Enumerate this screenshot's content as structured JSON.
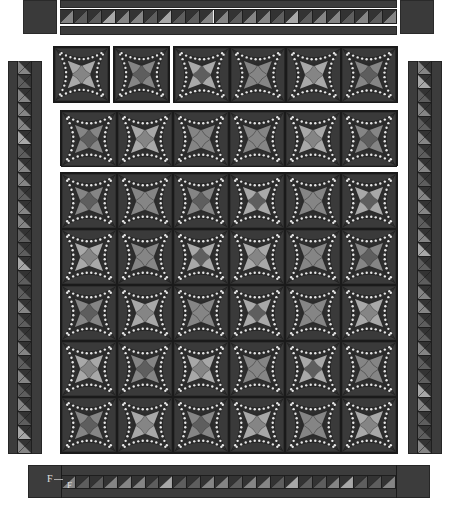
{
  "diagram": {
    "type": "quilt-layout",
    "colors": {
      "background": "#ffffff",
      "fabric_dark": "#3a3a3a",
      "seam": "#1a1a1a",
      "star_points": "#e8e8e8",
      "tone_light": "#a8a8a8",
      "tone_mid": "#858585",
      "tone_dark": "#5e5e5e"
    },
    "labels": {
      "bottom_border_outer": "F",
      "bottom_border_inner": "F"
    },
    "caption": "",
    "top_border": {
      "hst_count": 24,
      "tones": [
        "mid",
        "dark",
        "dark",
        "light",
        "mid",
        "mid",
        "dark",
        "light",
        "dark",
        "dark",
        "mid",
        "mid",
        "dark",
        "mid",
        "mid",
        "dark",
        "light",
        "dark",
        "mid",
        "mid",
        "dark",
        "mid",
        "dark",
        "mid"
      ]
    },
    "left_border": {
      "hst_count": 28,
      "tones": [
        "mid",
        "dark",
        "mid",
        "mid",
        "mid",
        "light",
        "dark",
        "mid",
        "mid",
        "dark",
        "mid",
        "mid",
        "dark",
        "dark",
        "light",
        "dark",
        "dark",
        "mid",
        "dark",
        "dark",
        "mid",
        "dark",
        "mid",
        "dark",
        "mid",
        "dark",
        "light",
        "mid"
      ]
    },
    "right_border": {
      "hst_count": 28,
      "tones": [
        "mid",
        "light",
        "dark",
        "mid",
        "dark",
        "mid",
        "dark",
        "mid",
        "dark",
        "mid",
        "mid",
        "dark",
        "mid",
        "light",
        "dark",
        "dark",
        "mid",
        "mid",
        "dark",
        "dark",
        "mid",
        "dark",
        "dark",
        "light",
        "mid",
        "dark",
        "dark",
        "mid"
      ]
    },
    "bottom_border": {
      "hst_count": 24,
      "tones": [
        "mid",
        "dark",
        "dark",
        "mid",
        "mid",
        "mid",
        "dark",
        "light",
        "dark",
        "dark",
        "mid",
        "mid",
        "dark",
        "mid",
        "mid",
        "dark",
        "light",
        "dark",
        "dark",
        "mid",
        "light",
        "dark",
        "dark",
        "mid"
      ]
    },
    "row1_separate_blocks": [
      {
        "center": "mid",
        "petals": "light"
      },
      {
        "center": "dark",
        "petals": "mid"
      }
    ],
    "row1_joined_blocks": [
      {
        "center": "dark",
        "petals": "light"
      },
      {
        "center": "mid",
        "petals": "mid"
      },
      {
        "center": "mid",
        "petals": "light"
      },
      {
        "center": "dark",
        "petals": "mid"
      }
    ],
    "row2_blocks": [
      {
        "center": "dark",
        "petals": "mid"
      },
      {
        "center": "mid",
        "petals": "light"
      },
      {
        "center": "mid",
        "petals": "mid"
      },
      {
        "center": "mid",
        "petals": "mid"
      },
      {
        "center": "mid",
        "petals": "light"
      },
      {
        "center": "dark",
        "petals": "mid"
      }
    ],
    "main_grid": {
      "rows": 5,
      "cols": 6,
      "blocks": [
        [
          {
            "center": "dark",
            "petals": "mid"
          },
          {
            "center": "mid",
            "petals": "mid"
          },
          {
            "center": "dark",
            "petals": "mid"
          },
          {
            "center": "dark",
            "petals": "light"
          },
          {
            "center": "mid",
            "petals": "mid"
          },
          {
            "center": "dark",
            "petals": "light"
          }
        ],
        [
          {
            "center": "mid",
            "petals": "light"
          },
          {
            "center": "mid",
            "petals": "mid"
          },
          {
            "center": "dark",
            "petals": "light"
          },
          {
            "center": "mid",
            "petals": "light"
          },
          {
            "center": "mid",
            "petals": "mid"
          },
          {
            "center": "dark",
            "petals": "mid"
          }
        ],
        [
          {
            "center": "dark",
            "petals": "mid"
          },
          {
            "center": "mid",
            "petals": "light"
          },
          {
            "center": "mid",
            "petals": "mid"
          },
          {
            "center": "dark",
            "petals": "light"
          },
          {
            "center": "mid",
            "petals": "mid"
          },
          {
            "center": "mid",
            "petals": "light"
          }
        ],
        [
          {
            "center": "mid",
            "petals": "light"
          },
          {
            "center": "dark",
            "petals": "mid"
          },
          {
            "center": "mid",
            "petals": "light"
          },
          {
            "center": "mid",
            "petals": "mid"
          },
          {
            "center": "dark",
            "petals": "light"
          },
          {
            "center": "mid",
            "petals": "mid"
          }
        ],
        [
          {
            "center": "dark",
            "petals": "mid"
          },
          {
            "center": "mid",
            "petals": "light"
          },
          {
            "center": "dark",
            "petals": "mid"
          },
          {
            "center": "mid",
            "petals": "light"
          },
          {
            "center": "mid",
            "petals": "mid"
          },
          {
            "center": "mid",
            "petals": "light"
          }
        ]
      ]
    }
  }
}
